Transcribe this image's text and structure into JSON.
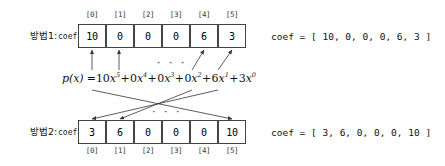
{
  "diagram": {
    "title_method1": "방법1:",
    "title_method2": "방법2:",
    "coef_label_1": "coef",
    "coef_label_2": "coef",
    "ellipsis_top": "· · ·",
    "ellipsis_bottom": "· · ·",
    "indices": [
      "[0]",
      "[1]",
      "[2]",
      "[3]",
      "[4]",
      "[5]"
    ],
    "array_method1": [
      "10",
      "0",
      "0",
      "0",
      "6",
      "3"
    ],
    "array_method2": [
      "3",
      "6",
      "0",
      "0",
      "0",
      "10"
    ],
    "coef_string_1": "coef = [ 10, 0, 0, 0, 6, 3 ]",
    "coef_string_2": "coef = [ 3, 6, 0, 0, 0, 10 ]",
    "formula": {
      "lhs": "p(x) =",
      "terms": [
        {
          "coef": "10",
          "var": "x",
          "exp": "5",
          "op": "+"
        },
        {
          "coef": "0",
          "var": "x",
          "exp": "4",
          "op": "+"
        },
        {
          "coef": "0",
          "var": "x",
          "exp": "3",
          "op": "+"
        },
        {
          "coef": "0",
          "var": "x",
          "exp": "2",
          "op": "+"
        },
        {
          "coef": "6",
          "var": "x",
          "exp": "1",
          "op": "+"
        },
        {
          "coef": "3",
          "var": "x",
          "exp": "0",
          "op": ""
        }
      ],
      "plain": "p(x) = 10x^5 + 0x^4 + 0x^3 + 0x^2 + 6x^1 + 3x^0"
    },
    "colors": {
      "box_border": "#444444",
      "text": "#111111",
      "arrow": "#333333",
      "background": "#ffffff"
    }
  }
}
